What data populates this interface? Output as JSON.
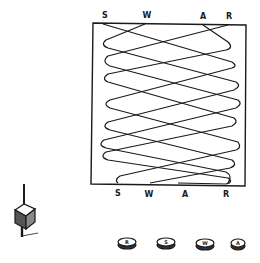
{
  "diagram": {
    "board": {
      "top_labels": [
        "S",
        "W",
        "A",
        "R"
      ],
      "bottom_labels": [
        "S",
        "W",
        "A",
        "R"
      ],
      "line_color": "#1a1a1a"
    },
    "spinning_top": {
      "icon": "spinning-top-icon"
    },
    "tokens": [
      {
        "label": "R"
      },
      {
        "label": "S"
      },
      {
        "label": "W"
      },
      {
        "label": "A"
      }
    ]
  }
}
